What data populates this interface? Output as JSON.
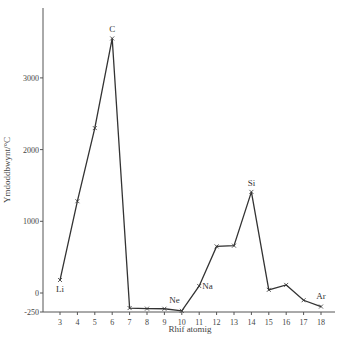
{
  "chart_data": {
    "type": "line",
    "title": "",
    "xlabel": "Rhif atomig",
    "ylabel": "Ymdoddbwynt/°C",
    "xlim": [
      2,
      19
    ],
    "ylim": [
      -250,
      3900
    ],
    "x_ticks": [
      3,
      4,
      5,
      6,
      7,
      8,
      9,
      10,
      11,
      12,
      13,
      14,
      15,
      16,
      17,
      18
    ],
    "y_ticks": [
      -250,
      0,
      1000,
      2000,
      3000
    ],
    "grid": false,
    "legend": null,
    "series": [
      {
        "name": "Ymdoddbwynt",
        "x": [
          3,
          4,
          5,
          6,
          7,
          8,
          9,
          10,
          11,
          12,
          13,
          14,
          15,
          16,
          17,
          18
        ],
        "values": [
          181,
          1280,
          2300,
          3550,
          -210,
          -218,
          -220,
          -249,
          98,
          650,
          660,
          1410,
          44,
          113,
          -101,
          -189
        ],
        "marker": "x",
        "color": "#333333"
      }
    ],
    "annotations": [
      {
        "x": 3,
        "text": "Li"
      },
      {
        "x": 6,
        "text": "C"
      },
      {
        "x": 10,
        "text": "Ne"
      },
      {
        "x": 11,
        "text": "Na"
      },
      {
        "x": 14,
        "text": "Si"
      },
      {
        "x": 18,
        "text": "Ar"
      }
    ]
  }
}
